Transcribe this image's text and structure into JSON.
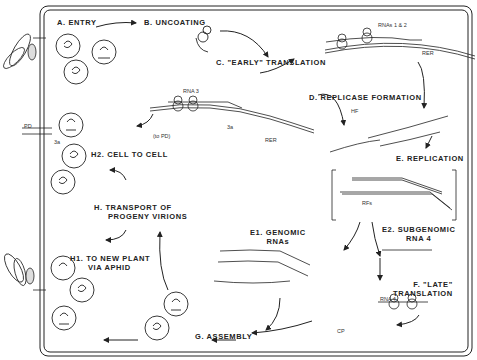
{
  "diagram": {
    "steps": {
      "a": "A. ENTRY",
      "b": "B. UNCOATING",
      "c": "C. \"EARLY\" TRANSLATION",
      "d": "D. REPLICASE FORMATION",
      "e": "E. REPLICATION",
      "e1_line1": "E1. GENOMIC",
      "e1_line2": "RNAs",
      "e2_line1": "E2. SUBGENOMIC",
      "e2_line2": "RNA 4",
      "f_line1": "F. \"LATE\"",
      "f_line2": "TRANSLATION",
      "g": "G. ASSEMBLY",
      "h_line1": "H. TRANSPORT OF",
      "h_line2": "PROGENY VIRIONS",
      "h1_line1": "H1. TO NEW PLANT",
      "h1_line2": "VIA APHID",
      "h2": "H2. CELL TO CELL"
    },
    "small_labels": {
      "rnas_1_2": "RNAs 1 & 2",
      "rna3": "RNA 3",
      "rna4": "RNA 4",
      "rer": "RER",
      "to_pd": "(to PD)",
      "pd": "PD",
      "p3a": "3a",
      "hf": "HF",
      "rfs": "RFs",
      "cp": "CP",
      "five_prime": "5'",
      "three_prime": "3'"
    }
  }
}
